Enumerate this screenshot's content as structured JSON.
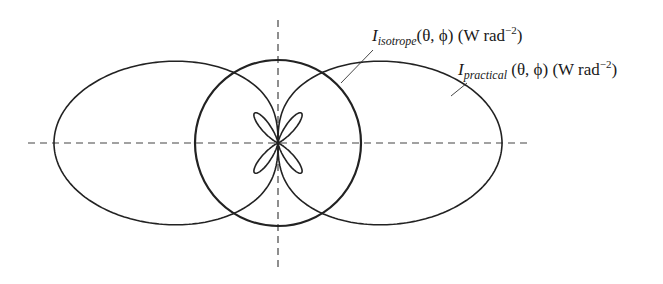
{
  "figure": {
    "type": "radiation pattern diagram",
    "labels": {
      "isotrope": {
        "symbol": "I",
        "subscript": "isotrope",
        "args": "(θ, ϕ)",
        "unit_prefix": " (W rad",
        "unit_exp": "−2",
        "unit_suffix": ")"
      },
      "practical": {
        "symbol": "I",
        "subscript": "practical",
        "args": " (θ, ϕ)",
        "unit_prefix": " (W rad",
        "unit_exp": "−2",
        "unit_suffix": ")"
      }
    },
    "curves": [
      {
        "name": "isotropic-radiator",
        "shape": "circle"
      },
      {
        "name": "practical-antenna",
        "shape": "two main lobes along horizontal axis with four small side lobes"
      }
    ],
    "axes": {
      "horizontal": "dashed",
      "vertical": "dashed"
    },
    "colors": {
      "stroke": "#222222",
      "background": "#ffffff"
    }
  }
}
